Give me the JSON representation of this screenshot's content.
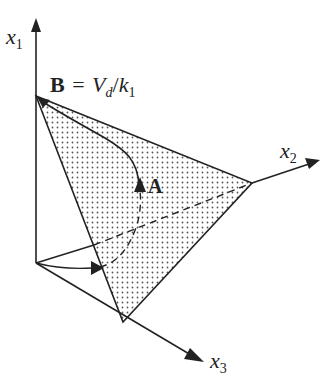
{
  "figure": {
    "type": "simplex-diagram",
    "axes": {
      "x1": {
        "name": "x",
        "sub": "1"
      },
      "x2": {
        "name": "x",
        "sub": "2"
      },
      "x3": {
        "name": "x",
        "sub": "3"
      }
    },
    "points": {
      "B": {
        "label": "B",
        "equation_rhs_V": "V",
        "equation_rhs_Vsub": "d",
        "equation_slash": "/",
        "equation_rhs_k": "k",
        "equation_rhs_ksub": "1",
        "equals": "="
      },
      "A": {
        "label": "A"
      }
    },
    "colors": {
      "line": "#222222",
      "fill_dots": "#555555",
      "background": "#ffffff"
    }
  }
}
